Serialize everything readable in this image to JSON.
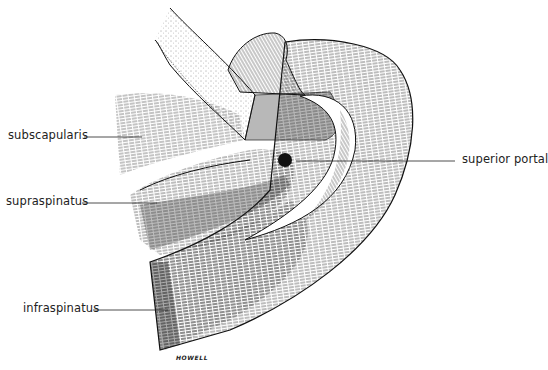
{
  "figure": {
    "type": "anatomical line illustration",
    "labels": {
      "subscapularis": "subscapularis",
      "supraspinatus": "supraspinatus",
      "infraspinatus": "infraspinatus",
      "superior_portal": "superior portal"
    },
    "signature": "HOWELL",
    "colors": {
      "background": "#ffffff",
      "ink": "#111111",
      "label_text": "#222222"
    }
  }
}
